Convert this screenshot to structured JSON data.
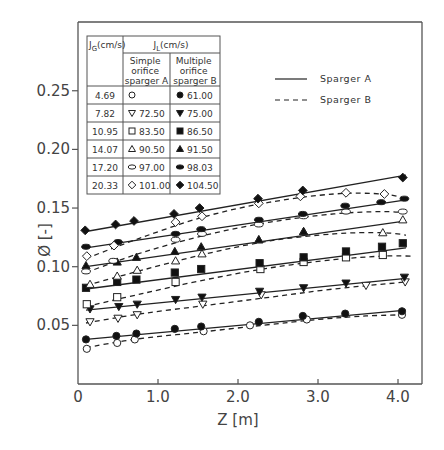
{
  "chart_data": {
    "type": "line",
    "title": "",
    "xlabel": "Z [m]",
    "ylabel": "Ø [-]",
    "xlim": [
      0,
      4.3
    ],
    "ylim": [
      0,
      0.27
    ],
    "x_ticks": [
      "0",
      "1.0",
      "2.0",
      "3.0",
      "4.0"
    ],
    "x_tick_values": [
      0,
      1,
      2,
      3,
      4
    ],
    "y_ticks": [
      "0.05",
      "0.10",
      "0.15",
      "0.20",
      "0.25"
    ],
    "y_tick_values": [
      0.05,
      0.1,
      0.15,
      0.2,
      0.25
    ],
    "grid": false,
    "legend": {
      "position": "upper right",
      "entries": [
        {
          "label": "Sparger A",
          "style": "solid"
        },
        {
          "label": "Sparger B",
          "style": "dashed"
        }
      ]
    },
    "table": {
      "headers": {
        "jg": "J_G(cm/s)",
        "jl": "J_L(cm/s)",
        "colA": [
          "Simple",
          "orifice",
          "sparger A"
        ],
        "colB": [
          "Multiple",
          "orifice",
          "sparger B"
        ]
      },
      "rows": [
        {
          "jg": "4.69",
          "a_marker": "open-circle",
          "a_value": "",
          "b_marker": "filled-circle",
          "b_value": "61.00"
        },
        {
          "jg": "7.82",
          "a_marker": "open-inv-triangle",
          "a_value": "72.50",
          "b_marker": "filled-inv-triangle",
          "b_value": "75.00"
        },
        {
          "jg": "10.95",
          "a_marker": "open-square",
          "a_value": "83.50",
          "b_marker": "filled-square",
          "b_value": "86.50"
        },
        {
          "jg": "14.07",
          "a_marker": "open-triangle",
          "a_value": "90.50",
          "b_marker": "filled-triangle",
          "b_value": "91.50"
        },
        {
          "jg": "17.20",
          "a_marker": "open-ellipse",
          "a_value": "97.00",
          "b_marker": "filled-ellipse",
          "b_value": "98.03"
        },
        {
          "jg": "20.33",
          "a_marker": "open-diamond",
          "a_value": "101.00",
          "b_marker": "filled-diamond",
          "b_value": "104.50"
        }
      ]
    },
    "series": [
      {
        "name": "Sparger A, J_G=4.69",
        "marker": "open-circle",
        "line": "dashed",
        "points": [
          [
            0.11,
            0.03
          ],
          [
            0.49,
            0.035
          ],
          [
            0.71,
            0.038
          ],
          [
            1.57,
            0.045
          ],
          [
            2.15,
            0.05
          ],
          [
            2.86,
            0.055
          ],
          [
            4.05,
            0.059
          ]
        ],
        "fit": [
          [
            0.1,
            0.031
          ],
          [
            0.7,
            0.038
          ],
          [
            1.5,
            0.044
          ],
          [
            2.3,
            0.05
          ],
          [
            3.0,
            0.055
          ],
          [
            3.6,
            0.058
          ],
          [
            4.1,
            0.059
          ]
        ]
      },
      {
        "name": "Sparger B, J_G=4.69",
        "marker": "filled-circle",
        "line": "solid",
        "points": [
          [
            0.1,
            0.038
          ],
          [
            0.48,
            0.041
          ],
          [
            0.73,
            0.043
          ],
          [
            1.21,
            0.047
          ],
          [
            1.54,
            0.049
          ],
          [
            2.26,
            0.053
          ],
          [
            2.81,
            0.058
          ],
          [
            3.34,
            0.06
          ],
          [
            4.05,
            0.062
          ]
        ],
        "fit": [
          [
            0.1,
            0.038
          ],
          [
            4.1,
            0.063
          ]
        ]
      },
      {
        "name": "Sparger A, J_G=7.82",
        "marker": "open-inv-triangle",
        "line": "dashed",
        "points": [
          [
            0.15,
            0.053
          ],
          [
            0.5,
            0.056
          ],
          [
            0.74,
            0.059
          ],
          [
            1.56,
            0.068
          ],
          [
            2.29,
            0.076
          ],
          [
            3.6,
            0.084
          ],
          [
            4.09,
            0.087
          ]
        ],
        "fit": [
          [
            0.1,
            0.052
          ],
          [
            0.8,
            0.06
          ],
          [
            1.6,
            0.067
          ],
          [
            2.4,
            0.074
          ],
          [
            3.2,
            0.081
          ],
          [
            4.1,
            0.087
          ]
        ]
      },
      {
        "name": "Sparger B, J_G=7.82",
        "marker": "filled-inv-triangle",
        "line": "solid",
        "points": [
          [
            0.15,
            0.064
          ],
          [
            0.51,
            0.066
          ],
          [
            0.74,
            0.068
          ],
          [
            1.22,
            0.072
          ],
          [
            1.55,
            0.074
          ],
          [
            2.27,
            0.079
          ],
          [
            2.82,
            0.082
          ],
          [
            3.35,
            0.086
          ],
          [
            4.08,
            0.091
          ]
        ],
        "fit": [
          [
            0.1,
            0.063
          ],
          [
            4.1,
            0.09
          ]
        ]
      },
      {
        "name": "Sparger A, J_G=10.95",
        "marker": "open-square",
        "line": "dashed",
        "points": [
          [
            0.11,
            0.068
          ],
          [
            0.49,
            0.074
          ],
          [
            1.22,
            0.087
          ],
          [
            2.28,
            0.098
          ],
          [
            2.82,
            0.104
          ],
          [
            3.35,
            0.108
          ],
          [
            3.81,
            0.11
          ]
        ],
        "fit": [
          [
            0.1,
            0.066
          ],
          [
            0.8,
            0.077
          ],
          [
            1.6,
            0.089
          ],
          [
            2.4,
            0.099
          ],
          [
            3.2,
            0.106
          ],
          [
            3.8,
            0.109
          ],
          [
            4.2,
            0.109
          ]
        ]
      },
      {
        "name": "Sparger B, J_G=10.95",
        "marker": "filled-square",
        "line": "solid",
        "points": [
          [
            0.1,
            0.082
          ],
          [
            0.49,
            0.087
          ],
          [
            0.73,
            0.089
          ],
          [
            1.21,
            0.095
          ],
          [
            1.54,
            0.098
          ],
          [
            2.27,
            0.103
          ],
          [
            2.82,
            0.108
          ],
          [
            3.35,
            0.113
          ],
          [
            3.8,
            0.117
          ],
          [
            4.06,
            0.12
          ]
        ],
        "fit": [
          [
            0.1,
            0.081
          ],
          [
            4.1,
            0.116
          ]
        ]
      },
      {
        "name": "Sparger A, J_G=14.07",
        "marker": "open-triangle",
        "line": "dashed",
        "points": [
          [
            0.15,
            0.085
          ],
          [
            0.49,
            0.092
          ],
          [
            0.74,
            0.097
          ],
          [
            1.22,
            0.105
          ],
          [
            1.55,
            0.111
          ],
          [
            2.26,
            0.123
          ],
          [
            2.82,
            0.13
          ],
          [
            3.81,
            0.129
          ],
          [
            4.06,
            0.14
          ]
        ],
        "fit": [
          [
            0.1,
            0.084
          ],
          [
            0.8,
            0.097
          ],
          [
            1.6,
            0.111
          ],
          [
            2.4,
            0.122
          ],
          [
            3.2,
            0.128
          ],
          [
            3.8,
            0.129
          ],
          [
            4.1,
            0.127
          ]
        ]
      },
      {
        "name": "Sparger B, J_G=14.07",
        "marker": "filled-triangle",
        "line": "solid",
        "points": [
          [
            0.1,
            0.101
          ],
          [
            0.49,
            0.104
          ],
          [
            0.73,
            0.108
          ],
          [
            1.21,
            0.113
          ],
          [
            1.54,
            0.117
          ],
          [
            2.26,
            0.123
          ],
          [
            2.82,
            0.13
          ]
        ],
        "fit": [
          [
            0.1,
            0.1
          ],
          [
            4.1,
            0.139
          ]
        ]
      },
      {
        "name": "Sparger A, J_G=17.20",
        "marker": "open-ellipse",
        "line": "dashed",
        "points": [
          [
            0.1,
            0.096
          ],
          [
            0.44,
            0.105
          ],
          [
            1.22,
            0.123
          ],
          [
            1.55,
            0.128
          ],
          [
            2.26,
            0.136
          ],
          [
            2.82,
            0.143
          ],
          [
            3.35,
            0.147
          ],
          [
            4.06,
            0.147
          ]
        ],
        "fit": [
          [
            0.1,
            0.095
          ],
          [
            0.8,
            0.112
          ],
          [
            1.6,
            0.127
          ],
          [
            2.4,
            0.138
          ],
          [
            3.2,
            0.145
          ],
          [
            3.8,
            0.147
          ],
          [
            4.1,
            0.146
          ]
        ]
      },
      {
        "name": "Sparger B, J_G=17.20",
        "marker": "filled-ellipse",
        "line": "solid",
        "points": [
          [
            0.1,
            0.117
          ],
          [
            0.5,
            0.121
          ],
          [
            1.22,
            0.128
          ],
          [
            1.54,
            0.132
          ],
          [
            2.26,
            0.14
          ],
          [
            2.81,
            0.145
          ],
          [
            3.34,
            0.152
          ],
          [
            3.79,
            0.155
          ],
          [
            4.08,
            0.158
          ]
        ],
        "fit": [
          [
            0.1,
            0.116
          ],
          [
            4.1,
            0.157
          ]
        ]
      },
      {
        "name": "Sparger A, J_G=20.33",
        "marker": "open-diamond",
        "line": "dashed",
        "points": [
          [
            0.11,
            0.109
          ],
          [
            0.45,
            0.118
          ],
          [
            1.22,
            0.138
          ],
          [
            1.55,
            0.143
          ],
          [
            2.26,
            0.154
          ],
          [
            2.78,
            0.16
          ],
          [
            3.35,
            0.163
          ],
          [
            3.83,
            0.162
          ]
        ],
        "fit": [
          [
            0.1,
            0.107
          ],
          [
            0.8,
            0.125
          ],
          [
            1.6,
            0.143
          ],
          [
            2.4,
            0.155
          ],
          [
            3.2,
            0.162
          ],
          [
            3.8,
            0.162
          ],
          [
            4.1,
            0.158
          ]
        ]
      },
      {
        "name": "Sparger B, J_G=20.33",
        "marker": "filled-diamond",
        "line": "solid",
        "points": [
          [
            0.09,
            0.131
          ],
          [
            0.47,
            0.136
          ],
          [
            0.7,
            0.139
          ],
          [
            1.2,
            0.145
          ],
          [
            1.52,
            0.15
          ],
          [
            2.25,
            0.158
          ],
          [
            2.81,
            0.165
          ],
          [
            4.06,
            0.176
          ]
        ],
        "fit": [
          [
            0.1,
            0.13
          ],
          [
            4.1,
            0.178
          ]
        ]
      }
    ]
  }
}
